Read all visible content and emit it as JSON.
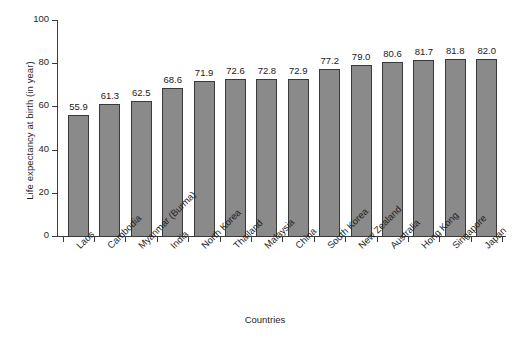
{
  "chart_data": {
    "type": "bar",
    "title": "",
    "xlabel": "Countries",
    "ylabel": "Life expectancy at birth (in year)",
    "ylim": [
      0,
      100
    ],
    "yticks": [
      0,
      20,
      40,
      60,
      80,
      100
    ],
    "grid": false,
    "legend": null,
    "bar_color": "#8a8a8a",
    "bar_edge_color": "#3a3a3a",
    "value_labels": true,
    "categories": [
      "Laos",
      "Cambodia",
      "Myanmar (Burma)",
      "India",
      "North Korea",
      "Thailand",
      "Malaysia",
      "China",
      "South Korea",
      "New Zealand",
      "Australia",
      "Hong Kong",
      "Singapore",
      "Japan"
    ],
    "values": [
      55.9,
      61.3,
      62.5,
      68.6,
      71.9,
      72.6,
      72.8,
      72.9,
      77.2,
      79.0,
      80.6,
      81.7,
      81.8,
      82.0
    ],
    "value_text": [
      "55.9",
      "61.3",
      "62.5",
      "68.6",
      "71.9",
      "72.6",
      "72.8",
      "72.9",
      "77.2",
      "79.0",
      "80.6",
      "81.7",
      "81.8",
      "82.0"
    ],
    "ytick_text": [
      "0",
      "20",
      "40",
      "60",
      "80",
      "100"
    ]
  }
}
